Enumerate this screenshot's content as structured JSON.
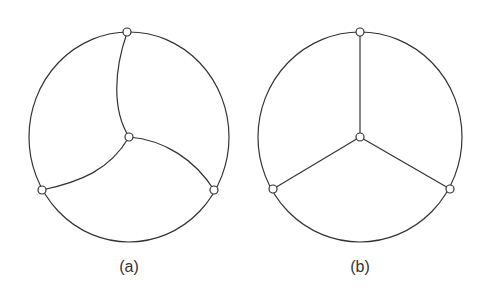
{
  "figures": [
    {
      "id": "a",
      "label": "(a)",
      "description": "Planar graph drawing with curved edges: outer circle with three boundary nodes and one interior node joined by curved arcs"
    },
    {
      "id": "b",
      "label": "(b)",
      "description": "Same graph drawn with straight edges from the interior node to three boundary nodes"
    }
  ],
  "colors": {
    "stroke": "#333333",
    "node_fill": "#ffffff"
  }
}
